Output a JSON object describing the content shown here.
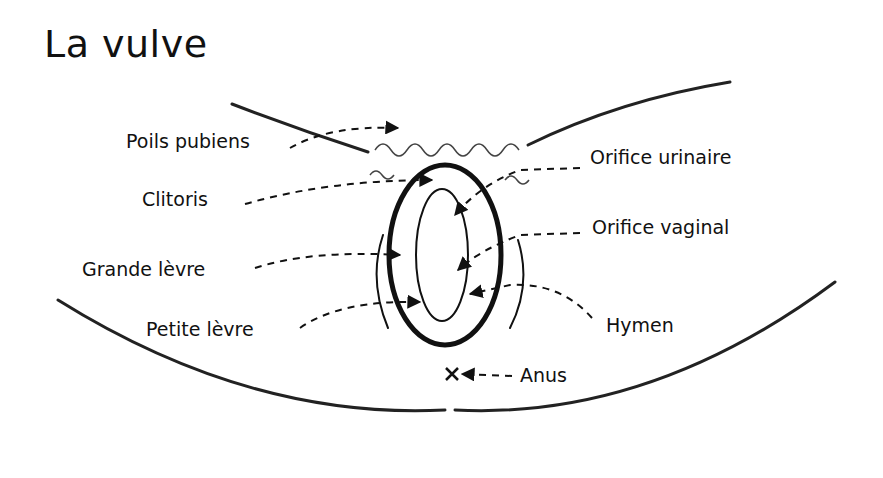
{
  "title": "La vulve",
  "labels": {
    "poils_pubiens": "Poils pubiens",
    "clitoris": "Clitoris",
    "grande_levre": "Grande lèvre",
    "petite_levre": "Petite lèvre",
    "orifice_urinaire": "Orifice urinaire",
    "orifice_vaginal": "Orifice vaginal",
    "hymen": "Hymen",
    "anus": "Anus"
  }
}
